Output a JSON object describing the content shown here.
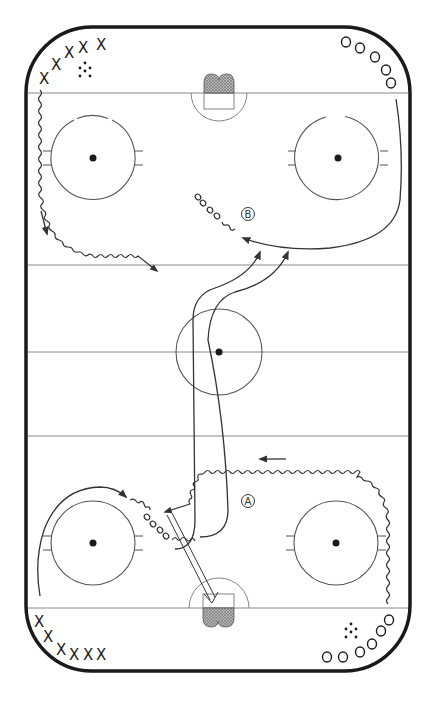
{
  "diagram": {
    "type": "hockey-rink-drill",
    "colors": {
      "boards": "#1a1a1a",
      "lines": "#888888",
      "paths": "#333333",
      "net_fill": "#aaaaaa"
    },
    "labels": {
      "a": "A",
      "b": "B"
    },
    "players": {
      "top_left_x_group": {
        "symbol": "X",
        "count": 6
      },
      "top_right_o_group": {
        "symbol": "O",
        "count": 5
      },
      "bottom_left_x_group": {
        "symbol": "X",
        "count": 6
      },
      "bottom_right_o_group": {
        "symbol": "O",
        "count": 5
      }
    },
    "pucks": {
      "top_left": "puck-pile",
      "bottom_right": "puck-pile"
    },
    "x_symbol": "X"
  }
}
